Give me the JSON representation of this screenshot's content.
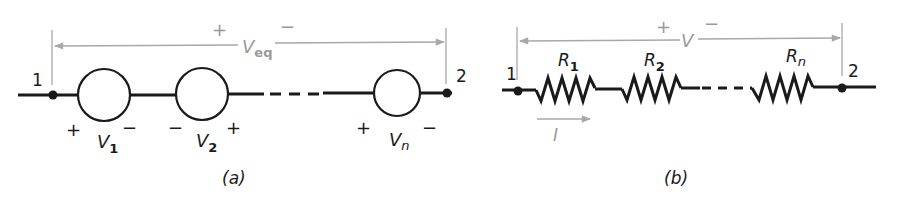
{
  "figure": {
    "panel_a": {
      "caption": "(a)",
      "node_left": "1",
      "node_right": "2",
      "across_voltage": {
        "symbol": "V",
        "subscript": "eq",
        "plus": "+",
        "minus": "−"
      },
      "sources": [
        {
          "symbol": "V",
          "subscript": "1",
          "left_sign": "+",
          "right_sign": "−"
        },
        {
          "symbol": "V",
          "subscript": "2",
          "left_sign": "−",
          "right_sign": "+"
        },
        {
          "symbol": "V",
          "subscript": "n",
          "left_sign": "+",
          "right_sign": "−"
        }
      ]
    },
    "panel_b": {
      "caption": "(b)",
      "node_left": "1",
      "node_right": "2",
      "across_voltage": {
        "symbol": "V",
        "plus": "+",
        "minus": "−"
      },
      "current": {
        "symbol": "I"
      },
      "resistors": [
        {
          "symbol": "R",
          "subscript": "1"
        },
        {
          "symbol": "R",
          "subscript": "2"
        },
        {
          "symbol": "R",
          "subscript": "n"
        }
      ]
    }
  },
  "colors": {
    "ink": "#1a1a1a",
    "annotation_grey": "#9a9a9a",
    "background": "#ffffff"
  }
}
